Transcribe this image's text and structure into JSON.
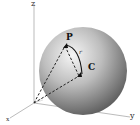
{
  "figure": {
    "type": "3d-sphere-diagram",
    "axes": {
      "z_label": "z",
      "y_label": "y",
      "x_label": "x"
    },
    "points": {
      "p_label": "P",
      "c_label": "C"
    },
    "arc_label": "r",
    "colors": {
      "sphere_light": "#f4f4f4",
      "sphere_dark": "#5a5a5a",
      "axis": "#999999",
      "dashed": "#222222"
    }
  }
}
